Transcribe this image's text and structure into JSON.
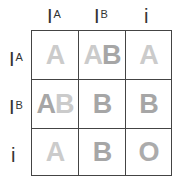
{
  "columns": [
    {
      "base": "I",
      "sup": "A"
    },
    {
      "base": "I",
      "sup": "B"
    },
    {
      "base": "i",
      "sup": ""
    }
  ],
  "rows": [
    {
      "base": "I",
      "sup": "A"
    },
    {
      "base": "I",
      "sup": "B"
    },
    {
      "base": "i",
      "sup": ""
    }
  ],
  "cells": [
    [
      "A",
      "AB",
      "A"
    ],
    [
      "AB",
      "B",
      "B"
    ],
    [
      "A",
      "B",
      "O"
    ]
  ],
  "colors": {
    "allele_A": "#cbcbcb",
    "allele_B": "#a6a6a6",
    "type_O": "#ababab",
    "grid": "#444444",
    "header": "#333333"
  }
}
